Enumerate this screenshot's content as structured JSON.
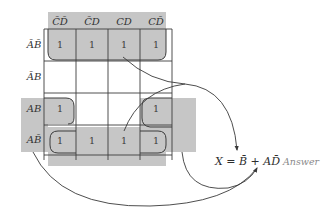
{
  "diagram": {
    "type": "karnaugh-map",
    "variables": [
      "A",
      "B",
      "C",
      "D"
    ],
    "column_headers": [
      {
        "label": "C̄D̄",
        "value": "00"
      },
      {
        "label": "C̄D",
        "value": "01"
      },
      {
        "label": "CD",
        "value": "11"
      },
      {
        "label": "CD̄",
        "value": "10"
      }
    ],
    "row_headers": [
      {
        "label": "ĀB̄",
        "value": "00"
      },
      {
        "label": "ĀB",
        "value": "01"
      },
      {
        "label": "AB",
        "value": "11"
      },
      {
        "label": "AB̄",
        "value": "10"
      }
    ],
    "cells": [
      [
        "1",
        "1",
        "1",
        "1"
      ],
      [
        "",
        "",
        "",
        ""
      ],
      [
        "1",
        "",
        "",
        "1"
      ],
      [
        "1",
        "1",
        "1",
        "1"
      ]
    ],
    "groups": [
      {
        "name": "B-bar group",
        "description": "rows ĀB̄ and AB̄ (wrap-around), all columns",
        "term": "B̄"
      },
      {
        "name": "A D-bar group",
        "description": "rows AB and AB̄, columns C̄D̄ and CD̄ (wrap-around)",
        "term": "AD̄"
      }
    ],
    "result": {
      "lhs": "X",
      "equals": "=",
      "term1": "B̄",
      "plus": "+",
      "term2": "AD̄",
      "full": "X = B̄ + AD̄"
    },
    "answer_label": "Answer",
    "colors": {
      "shade": "#c2c2c2",
      "grid_line": "#3c3c3c",
      "text": "#333333",
      "answer_text": "#8a8a8a"
    }
  }
}
